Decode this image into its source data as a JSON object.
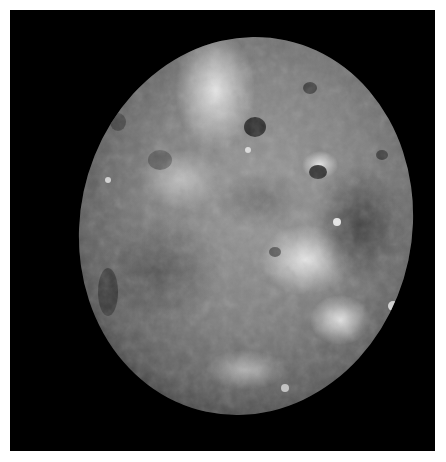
{
  "image": {
    "subject": "moon",
    "description": "Grayscale photograph of a cratered moon on a black space background with a white border",
    "background_color": "#000000",
    "border_color": "#ffffff",
    "surface_colors": {
      "bright": "#e6e6e6",
      "mid": "#8c8c8c",
      "dark": "#3c3c3c"
    }
  }
}
